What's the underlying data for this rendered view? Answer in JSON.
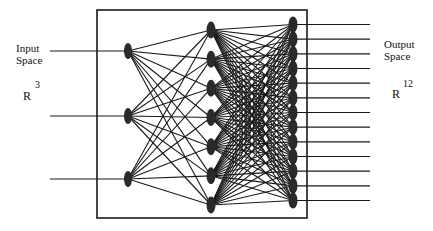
{
  "diagram": {
    "type": "neural-network",
    "input_label": {
      "line1": "Input",
      "line2": "Space"
    },
    "input_space": {
      "base": "R",
      "exponent": "3"
    },
    "output_label": {
      "line1": "Output",
      "line2": "Space"
    },
    "output_space": {
      "base": "R",
      "exponent": "12"
    },
    "layers": {
      "input_nodes": 3,
      "hidden_nodes": 7,
      "output_nodes": 13
    },
    "colors": {
      "ink": "#1a1a1a",
      "node": "#2a2a2a",
      "background": "#ffffff"
    }
  }
}
